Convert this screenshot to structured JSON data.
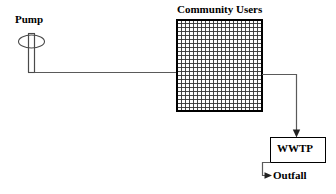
{
  "diagram": {
    "background_color": "#ffffff",
    "line_color": "#5a5a5a",
    "text_color": "#000000"
  },
  "nodes": {
    "pump": {
      "label": "Pump",
      "icon": "pump-symbol",
      "x": 28,
      "y": 33,
      "width": 7,
      "height": 40
    },
    "community_users": {
      "label": "Community Users",
      "icon": "grid-block",
      "x": 177,
      "y": 20,
      "width": 85,
      "height": 91,
      "columns": 21,
      "rows": 23
    },
    "wwtp": {
      "label": "WWTP",
      "x": 270,
      "y": 137,
      "width": 56,
      "height": 26
    },
    "outfall": {
      "label": "Outfall",
      "x": 273,
      "y": 170
    }
  },
  "connections": [
    {
      "name": "pump-to-community",
      "from": "pump",
      "to": "community_users",
      "arrow": false
    },
    {
      "name": "community-to-wwtp",
      "from": "community_users",
      "to": "wwtp",
      "arrow": true
    },
    {
      "name": "wwtp-to-outfall",
      "from": "wwtp",
      "to": "outfall",
      "arrow": true
    }
  ]
}
